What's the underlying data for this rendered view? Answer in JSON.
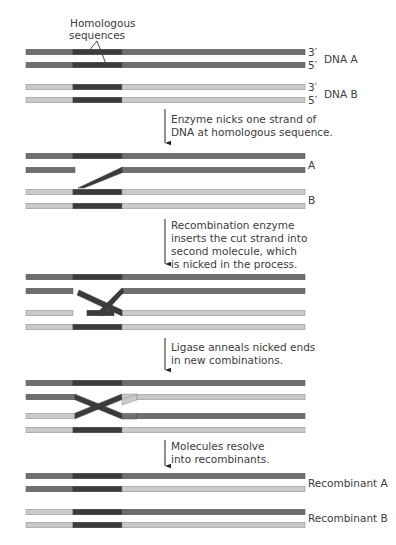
{
  "colors": {
    "strand_a": "#6e6e6e",
    "strand_a_edge": "#555555",
    "strand_b": "#c9c9c9",
    "strand_b_edge": "#8c8c8c",
    "homologous": "#3b3b3b",
    "text": "#3c3c3c",
    "arrow": "#222222"
  },
  "callout": {
    "line1": "Homologous",
    "line2": "sequences"
  },
  "panel1": {
    "end_labels": [
      "3′",
      "5′",
      "3′",
      "5′"
    ],
    "molecule_a": "DNA A",
    "molecule_b": "DNA B"
  },
  "panel2": {
    "label_a": "A",
    "label_b": "B"
  },
  "panel5": {
    "label_a": "Recombinant A",
    "label_b": "Recombinant B"
  },
  "steps": [
    {
      "lines": [
        "Enzyme nicks one strand of",
        "DNA at homologous sequence."
      ]
    },
    {
      "lines": [
        "Recombination enzyme",
        "inserts the cut strand into",
        "second molecule, which",
        "is nicked in the process."
      ]
    },
    {
      "lines": [
        "Ligase anneals nicked ends",
        "in new combinations."
      ]
    },
    {
      "lines": [
        "Molecules resolve",
        "into recombinants."
      ]
    }
  ]
}
